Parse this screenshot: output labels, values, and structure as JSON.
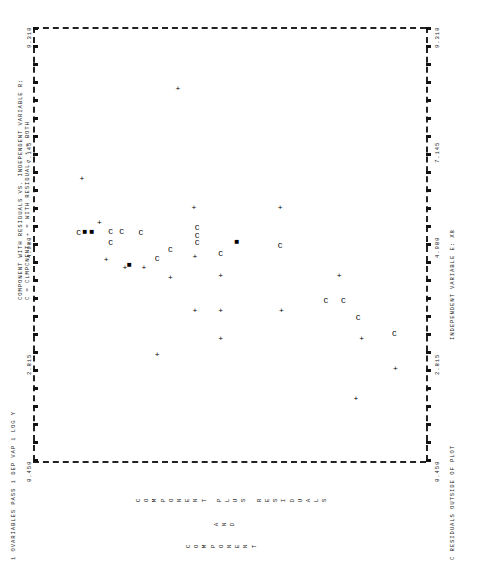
{
  "chart_data": {
    "type": "scatter",
    "title": "COMPONENT WITH RESIDUALS VS. INDEPENDENT VARIABLE R:",
    "subtitle": "C = CLMPCNENT, + = WITH RESIDUAL, * = BOTH",
    "xlabel": "INDEPENDENT VARIABLE E:   X8",
    "ylabel": "1 OVARIABLES PASS 1  DEP VAP 1  LOG Y",
    "caption": "COMPONENT PLUS RESIDUALS AND COMPONENT",
    "caption_lines": [
      "COMPONENT PLUS RESIDUALS",
      "AND",
      "COMPONENT"
    ],
    "footnote": "C RESIDUALS OUTSIDE OF PLOT",
    "orientation": "rotated-90",
    "grid": false,
    "legend_position": "title",
    "xlim": [
      0.45,
      9.31
    ],
    "ylim": [
      0.45,
      9.31
    ],
    "xticks": [
      "0.450",
      "2.815",
      "4.980",
      "7.145",
      "9.310"
    ],
    "yticks": [
      "0.450",
      "2.815",
      "4.980",
      "7.145",
      "9.310"
    ],
    "xtick_values": [
      0.45,
      2.815,
      4.98,
      7.145,
      9.31
    ],
    "ytick_values": [
      0.45,
      2.815,
      4.98,
      7.145,
      9.31
    ],
    "series": [
      {
        "name": "WITH RESIDUAL",
        "symbol": "+",
        "points": [
          [
            2.33,
            8.62
          ],
          [
            1.72,
            7.73
          ],
          [
            2.95,
            7.86
          ],
          [
            4.23,
            7.35
          ],
          [
            3.52,
            6.05
          ],
          [
            5.62,
            6.02
          ],
          [
            2.95,
            4.68
          ],
          [
            3.52,
            4.68
          ],
          [
            4.23,
            4.68
          ],
          [
            3.52,
            4.1
          ],
          [
            4.62,
            4.1
          ],
          [
            5.62,
            4.08
          ],
          [
            4.18,
            3.55
          ],
          [
            2.62,
            3.25
          ],
          [
            4.4,
            2.95
          ],
          [
            4.4,
            2.52
          ],
          [
            8.05,
            3.72
          ],
          [
            5.3,
            1.95
          ],
          [
            4.55,
            2.1
          ],
          [
            6.2,
            1.55
          ]
        ]
      },
      {
        "name": "CLMPCNENT",
        "symbol": "C",
        "points": [
          [
            3.05,
            8.6
          ],
          [
            3.38,
            7.78
          ],
          [
            3.72,
            7.45
          ],
          [
            3.72,
            7.05
          ],
          [
            4.83,
            6.02
          ],
          [
            4.68,
            4.68
          ],
          [
            4.9,
            4.15
          ],
          [
            5.05,
            4.15
          ],
          [
            5.2,
            4.15
          ],
          [
            4.75,
            3.55
          ],
          [
            4.58,
            3.25
          ],
          [
            5.1,
            2.88
          ],
          [
            5.12,
            2.45
          ],
          [
            4.9,
            2.2
          ],
          [
            5.12,
            2.2
          ],
          [
            5.1,
            1.48
          ]
        ]
      },
      {
        "name": "BOTH",
        "symbol": "*",
        "points": [
          [
            5.12,
            1.78
          ],
          [
            5.12,
            1.62
          ],
          [
            4.45,
            2.62
          ],
          [
            4.92,
            5.05
          ]
        ]
      }
    ],
    "n_points": 40
  },
  "axis": {
    "x_tick_labels": [
      "0.450",
      "2.815",
      "4.980",
      "7.145",
      "9.310"
    ],
    "y_tick_labels_left": [
      "0.450",
      "9.310"
    ],
    "y_tick_labels_right": [
      "0.450",
      "9.310"
    ]
  },
  "labels": {
    "title_line1": "COMPONENT WITH RESIDUALS VS. INDEPENDENT VARIABLE R:",
    "title_line2": "C = CLMPCNENT, + = WITH RESIDUAL, * = BOTH",
    "tick_4980": "4.980",
    "tick_7145": "7.145",
    "tick_2815": "2.815",
    "tick_0450": "0.450",
    "tick_9310": "9.310",
    "x_axis_title": "INDEPENDENT VARIABLE E:    X8",
    "x_axis_code": "X8",
    "y_axis_title": "1 OVARIABLES PASS 1   DEP VAP 1  LOG Y",
    "footnote": "C RESIDUALS OUTSIDE OF PLOT"
  },
  "colors": {
    "ink": "#111111",
    "paper": "#ffffff",
    "grid": "#222222"
  }
}
